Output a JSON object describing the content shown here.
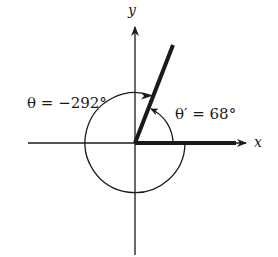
{
  "diagram": {
    "type": "angle-diagram",
    "axes": {
      "x_label": "x",
      "y_label": "y"
    },
    "angles": [
      {
        "name": "theta",
        "label": "θ = −292°",
        "value_deg": -292,
        "direction": "clockwise"
      },
      {
        "name": "reference",
        "label": "θ′ = 68°",
        "value_deg": 68,
        "direction": "counterclockwise"
      }
    ],
    "terminal_side_deg": 68,
    "colors": {
      "ink": "#1a1a1a",
      "background": "#ffffff"
    }
  }
}
